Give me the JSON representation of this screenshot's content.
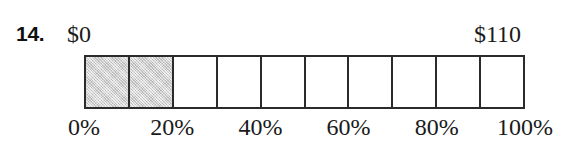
{
  "problem": {
    "number_label": "14."
  },
  "endpoints": {
    "left_label": "$0",
    "right_label": "$110"
  },
  "bar": {
    "total_cells": 10,
    "filled_cells": 2,
    "fill_color": "#d2d2d2",
    "border_color": "#2b2b2b",
    "empty_color": "#ffffff"
  },
  "axis": {
    "ticks": [
      {
        "label": "0%",
        "value": 0
      },
      {
        "label": "20%",
        "value": 20
      },
      {
        "label": "40%",
        "value": 40
      },
      {
        "label": "60%",
        "value": 60
      },
      {
        "label": "80%",
        "value": 80
      },
      {
        "label": "100%",
        "value": 100
      }
    ]
  },
  "chart_data": {
    "type": "bar",
    "title": "",
    "subtitle": "",
    "xlabel": "",
    "ylabel": "",
    "categories": [
      "0-10%",
      "10-20%",
      "20-30%",
      "30-40%",
      "40-50%",
      "50-60%",
      "60-70%",
      "70-80%",
      "80-90%",
      "90-100%"
    ],
    "values": [
      1,
      1,
      0,
      0,
      0,
      0,
      0,
      0,
      0,
      0
    ],
    "shaded_fraction": 0.2,
    "scale_min_label": "$0",
    "scale_max_label": "$110",
    "scale_min": 0,
    "scale_max": 110,
    "shaded_value": 22,
    "axis_tick_labels": [
      "0%",
      "20%",
      "40%",
      "60%",
      "80%",
      "100%"
    ],
    "axis_tick_values": [
      0,
      20,
      40,
      60,
      80,
      100
    ],
    "xlim": [
      0,
      100
    ],
    "grid": false,
    "legend": "none"
  }
}
